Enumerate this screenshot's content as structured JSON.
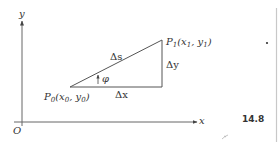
{
  "diagram": {
    "axes": {
      "y_label": "y",
      "x_label": "x",
      "origin_label": "O"
    },
    "points": {
      "p0": {
        "name": "P",
        "sub": "0",
        "coords": "(x",
        "coords_sub1": "0",
        "sep": ", y",
        "coords_sub2": "0",
        "close": ")"
      },
      "p1": {
        "name": "P",
        "sub": "1",
        "coords": "(x",
        "coords_sub1": "1",
        "sep": ", y",
        "coords_sub2": "1",
        "close": ")"
      }
    },
    "triangle_labels": {
      "hypotenuse": "Δs",
      "horizontal": "Δx",
      "vertical": "Δy",
      "angle": "φ"
    },
    "figure_number": "14.8",
    "colors": {
      "line": "#555555",
      "text": "#333333",
      "margin_line": "#bbbbbb"
    }
  }
}
